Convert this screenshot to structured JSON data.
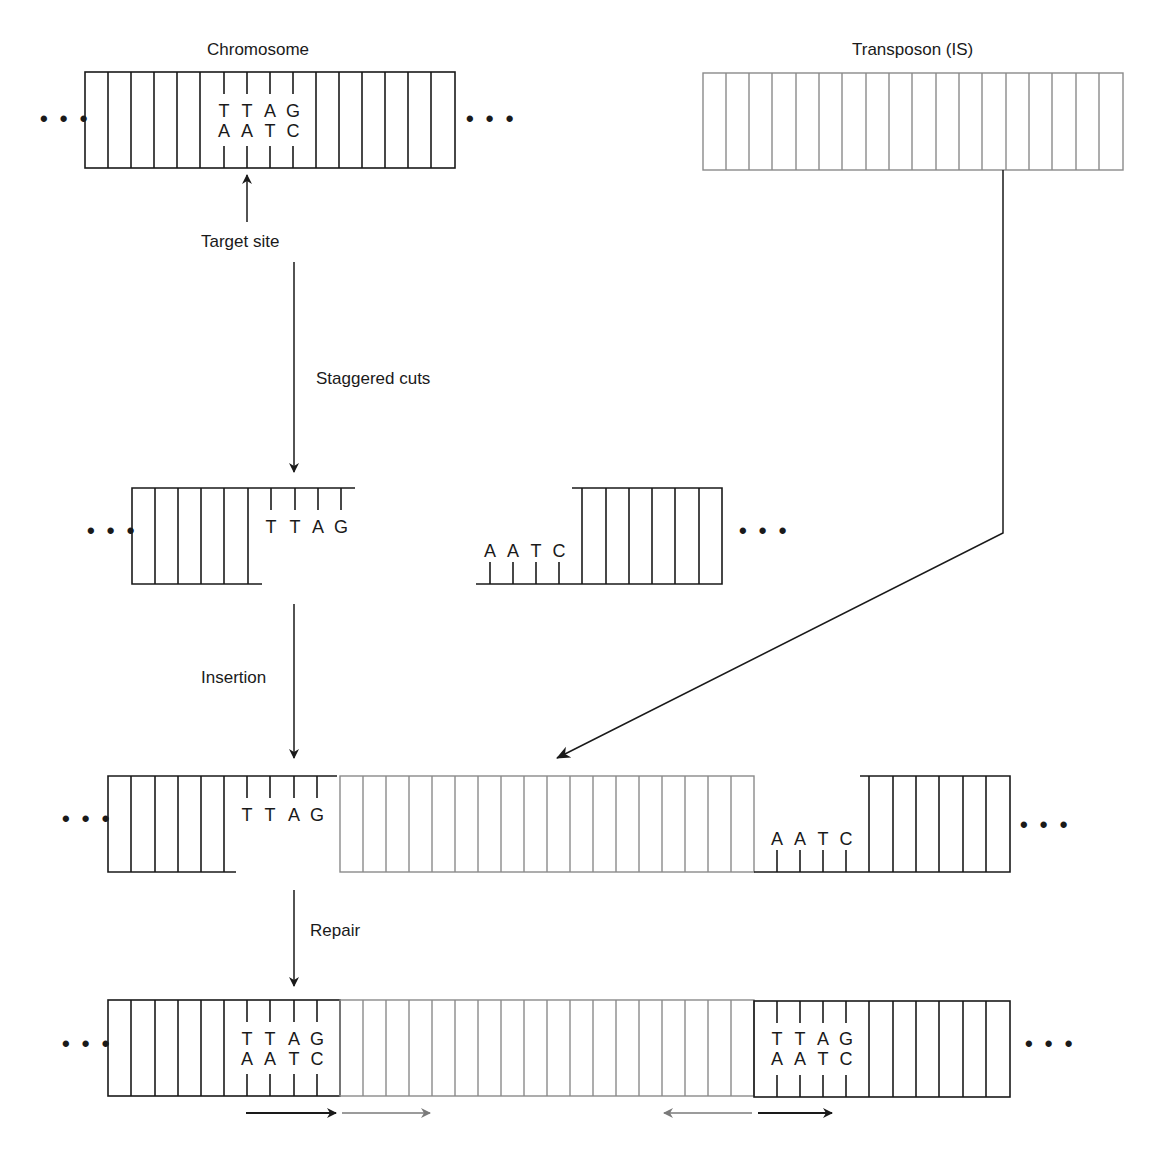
{
  "labels": {
    "chromosome": "Chromosome",
    "transposon": "Transposon (IS)",
    "target_site": "Target site",
    "staggered_cuts": "Staggered cuts",
    "insertion": "Insertion",
    "repair": "Repair"
  },
  "ellipsis": "• • •",
  "colors": {
    "dna_black": "#1a1a1a",
    "transposon_grey": "#8a8a8a",
    "arrow_grey": "#7a7a7a"
  },
  "sequence": {
    "top_strand": [
      "T",
      "T",
      "A",
      "G"
    ],
    "bottom_strand": [
      "A",
      "A",
      "T",
      "C"
    ]
  },
  "steps": [
    {
      "name": "chromosome",
      "label": "Chromosome"
    },
    {
      "name": "staggered-cuts",
      "label": "Staggered cuts"
    },
    {
      "name": "insertion",
      "label": "Insertion"
    },
    {
      "name": "repair",
      "label": "Repair"
    }
  ],
  "direct_repeat_arrows": [
    {
      "color": "black",
      "direction": "right"
    },
    {
      "color": "grey",
      "direction": "right"
    },
    {
      "color": "grey",
      "direction": "left"
    },
    {
      "color": "black",
      "direction": "right"
    }
  ]
}
